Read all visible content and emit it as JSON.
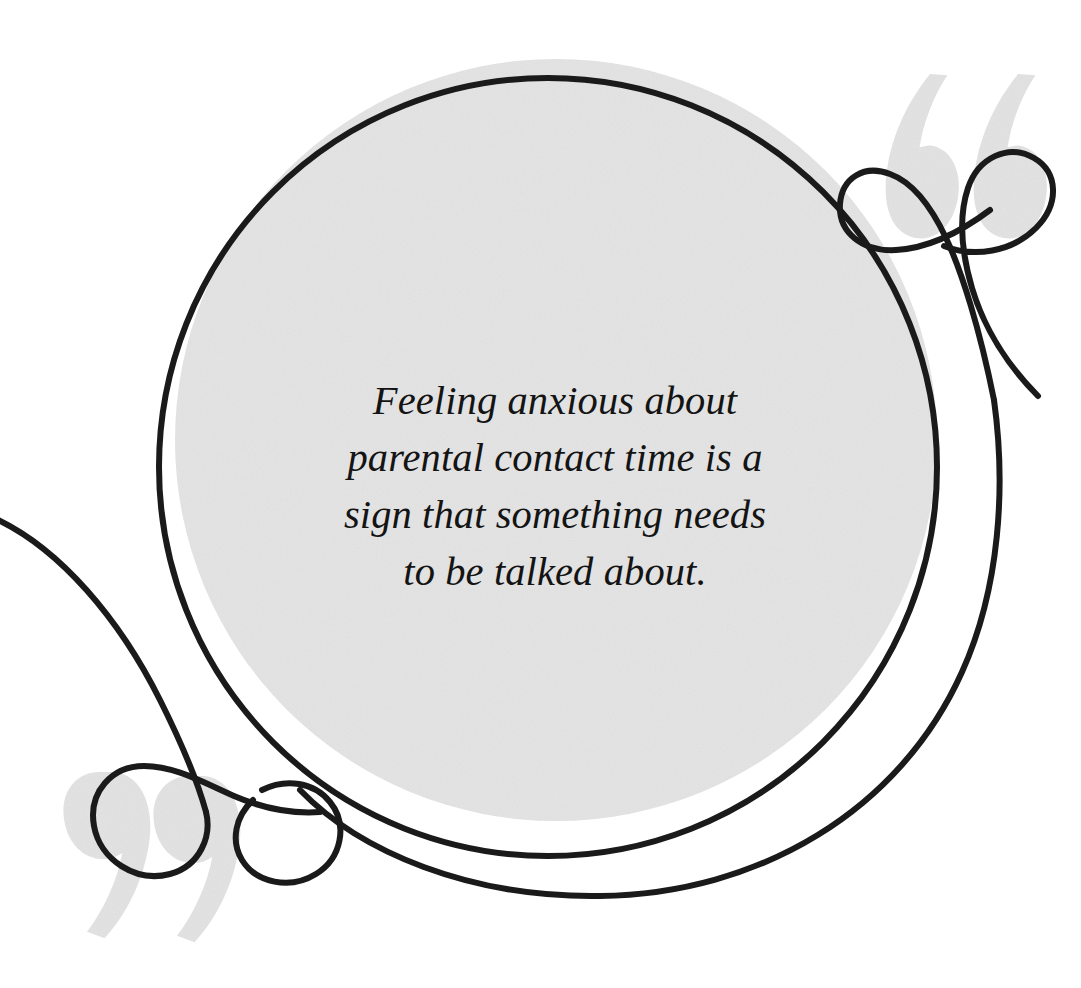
{
  "canvas": {
    "width": 1081,
    "height": 988,
    "background_color": "#ffffff"
  },
  "quote": {
    "text": "Feeling anxious about\nparental contact time is a\nsign that something needs\nto be talked about.",
    "lines": [
      "Feeling anxious about",
      "parental contact time is a",
      "sign that something needs",
      "to be talked about."
    ],
    "text_color": "#141414",
    "style": "italic-serif"
  },
  "decor": {
    "circle_fill_color": "#e4e4e4",
    "circle_stroke_color": "#1a1a1a",
    "quote_mark_color": "#e3e3e3",
    "line_color": "#1a1a1a",
    "filled_circle": {
      "cx": 556,
      "cy": 440,
      "r": 381
    },
    "outline_circle": {
      "cx": 548,
      "cy": 467,
      "r": 389,
      "stroke_width": 6
    },
    "top_right_ornament": "opening-double-quote-loops",
    "bottom_left_ornament": "closing-double-quote-loops"
  }
}
